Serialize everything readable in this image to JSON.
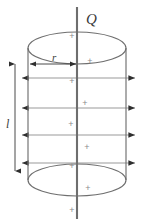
{
  "figure": {
    "type": "physics-diagram",
    "canvas": {
      "width": 147,
      "height": 222,
      "background": "#ffffff"
    },
    "colors": {
      "axis": "#6e6e6e",
      "outline": "#6f6f6f",
      "field_line": "#9a9a9a",
      "dimension": "#4a4a4a",
      "charge": "#8d8d8d",
      "label": "#3a3a3a"
    },
    "labels": {
      "charge_symbol": "Q",
      "radius_symbol": "r",
      "length_symbol": "l",
      "charge_marker": "+"
    },
    "axis": {
      "name": "charge-axis",
      "x": 77,
      "y_top": 7,
      "y_bottom": 219,
      "stroke_width": 2.1
    },
    "cylinder": {
      "center_x": 77,
      "left_x": 28,
      "right_x": 126,
      "radius_x": 49,
      "top_ellipse_cy": 48,
      "bottom_ellipse_cy": 180,
      "ellipse_ry": 16,
      "wall_top": 48,
      "wall_bottom": 180
    },
    "radius_dimension": {
      "name": "radius-arrow",
      "y": 64,
      "x_start": 29,
      "x_end": 77,
      "label_x": 55,
      "label_y": 60
    },
    "length_dimension": {
      "name": "length-arrow",
      "x": 15,
      "y_top": 62,
      "y_bottom": 172,
      "label_x": 8,
      "label_y": 124
    },
    "field_lines": [
      {
        "y": 78,
        "x_left": 20,
        "x_right": 137
      },
      {
        "y": 108,
        "x_left": 20,
        "x_right": 137
      },
      {
        "y": 135,
        "x_left": 20,
        "x_right": 137
      },
      {
        "y": 163,
        "x_left": 20,
        "x_right": 137
      }
    ],
    "charges": [
      {
        "x": 72,
        "y": 36
      },
      {
        "x": 90,
        "y": 61
      },
      {
        "x": 72,
        "y": 81
      },
      {
        "x": 85,
        "y": 103
      },
      {
        "x": 71,
        "y": 124
      },
      {
        "x": 87,
        "y": 147
      },
      {
        "x": 72,
        "y": 166
      },
      {
        "x": 88,
        "y": 188
      },
      {
        "x": 72,
        "y": 210
      }
    ],
    "charge_label_positions": {
      "q_x": 86,
      "q_y": 24
    }
  }
}
